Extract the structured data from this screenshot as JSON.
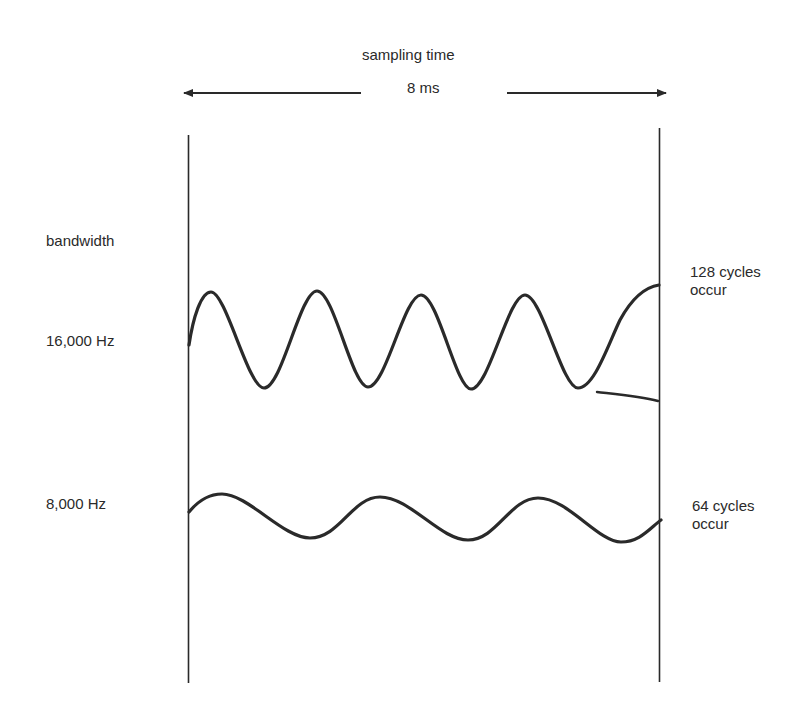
{
  "header": {
    "title": "sampling time",
    "duration": "8 ms"
  },
  "left_axis": {
    "title": "bandwidth",
    "rows": [
      {
        "label": "16,000 Hz"
      },
      {
        "label": "8,000 Hz"
      }
    ]
  },
  "right_annotations": [
    {
      "line1": "128 cycles",
      "line2": "occur"
    },
    {
      "line1": "64 cycles",
      "line2": "occur"
    }
  ],
  "waves": [
    {
      "name": "16000-hz-wave",
      "visible_peaks": 5,
      "color": "#2a2a2a"
    },
    {
      "name": "8000-hz-wave",
      "visible_peaks": 3,
      "color": "#2a2a2a"
    }
  ],
  "colors": {
    "ink": "#2a2a2a",
    "background": "#ffffff"
  }
}
